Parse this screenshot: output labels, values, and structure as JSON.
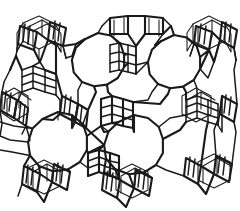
{
  "figure": {
    "kind": "line-drawing",
    "framework_type": "FAU (faujasite)",
    "caption": "",
    "title": "",
    "background_color": "#ffffff",
    "line_color": "#1a1a1a",
    "canvas": {
      "width": 240,
      "height": 211
    },
    "text_labels": []
  },
  "structure": {
    "description": "Polyhedral wireframe of a faujasite-type zeolite: sodalite cages (truncated octahedra) linked through hexagonal prisms, enclosing large 12-membered-ring supercage windows.",
    "supercage_windows": [
      {
        "name": "window-top-left",
        "cx": 98,
        "cy": 60,
        "r": 27,
        "sides": 12,
        "rotation": 15
      },
      {
        "name": "window-top-right",
        "cx": 174,
        "cy": 62,
        "r": 27,
        "sides": 12,
        "rotation": 15
      },
      {
        "name": "window-bottom-left",
        "cx": 58,
        "cy": 142,
        "r": 30,
        "sides": 12,
        "rotation": 15
      },
      {
        "name": "window-bottom-center",
        "cx": 134,
        "cy": 145,
        "r": 30,
        "sides": 12,
        "rotation": 15
      }
    ],
    "sodalite_cages": [
      {
        "name": "cage-top-left",
        "cx": 40,
        "cy": 44
      },
      {
        "name": "cage-top-center",
        "cx": 134,
        "cy": 26
      },
      {
        "name": "cage-top-right",
        "cx": 216,
        "cy": 40
      },
      {
        "name": "cage-mid-left",
        "cx": 14,
        "cy": 108
      },
      {
        "name": "cage-mid-center",
        "cx": 96,
        "cy": 108
      },
      {
        "name": "cage-mid-right",
        "cx": 196,
        "cy": 112
      },
      {
        "name": "cage-bottom-left",
        "cx": 44,
        "cy": 184
      },
      {
        "name": "cage-bottom-center",
        "cx": 132,
        "cy": 190
      },
      {
        "name": "cage-bottom-right",
        "cx": 214,
        "cy": 178
      }
    ],
    "double_six_rings": [
      {
        "name": "d6r-upper-center",
        "cx": 120,
        "cy": 57
      },
      {
        "name": "d6r-left-upper",
        "cx": 36,
        "cy": 78
      },
      {
        "name": "d6r-center",
        "cx": 116,
        "cy": 110
      },
      {
        "name": "d6r-right",
        "cx": 200,
        "cy": 108
      },
      {
        "name": "d6r-lower-center",
        "cx": 100,
        "cy": 160
      }
    ]
  },
  "chart_data": {
    "type": "diagram",
    "title": "",
    "xlabel": "",
    "ylabel": "",
    "annotations": [],
    "legend": []
  }
}
